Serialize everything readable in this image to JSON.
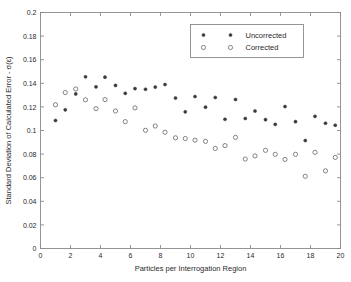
{
  "chart_data": {
    "type": "scatter",
    "title": "",
    "xlabel": "Particles per Interrogation Region",
    "ylabel": "Standard Deviation of Calculated Error - σ(ε)",
    "xlim": [
      0,
      20
    ],
    "ylim": [
      0,
      0.2
    ],
    "xticks": [
      "0",
      "2",
      "4",
      "6",
      "8",
      "10",
      "12",
      "14",
      "16",
      "18",
      "20"
    ],
    "xtick_values": [
      0,
      2,
      4,
      6,
      8,
      10,
      12,
      14,
      16,
      18,
      20
    ],
    "yticks": [
      "0",
      "0.02",
      "0.04",
      "0.06",
      "0.08",
      "0.1",
      "0.12",
      "0.14",
      "0.16",
      "0.18",
      "0.2"
    ],
    "ytick_values": [
      0,
      0.02,
      0.04,
      0.06,
      0.08,
      0.1,
      0.12,
      0.14,
      0.16,
      0.18,
      0.2
    ],
    "grid": false,
    "legend_position": "top-right",
    "series": [
      {
        "name": "Uncorrected",
        "marker": "filled-circle",
        "color": "#3a3a3a",
        "x": [
          1.0,
          1.65,
          2.35,
          3.0,
          3.7,
          4.3,
          5.0,
          5.65,
          6.3,
          7.0,
          7.65,
          8.3,
          9.0,
          9.65,
          10.3,
          11.0,
          11.65,
          12.3,
          13.0,
          13.65,
          14.3,
          15.0,
          15.65,
          16.3,
          17.0,
          17.65,
          18.3,
          19.0,
          19.65
        ],
        "y": [
          0.1085,
          0.1175,
          0.131,
          0.1455,
          0.137,
          0.1452,
          0.1382,
          0.1315,
          0.1355,
          0.135,
          0.1368,
          0.139,
          0.1275,
          0.1158,
          0.1288,
          0.1198,
          0.128,
          0.1095,
          0.1263,
          0.1102,
          0.1165,
          0.1092,
          0.1052,
          0.1203,
          0.1075,
          0.0915,
          0.112,
          0.1062,
          0.1045
        ]
      },
      {
        "name": "Corrected",
        "marker": "open-circle",
        "color": "#6e6e6e",
        "x": [
          1.0,
          1.65,
          2.35,
          3.0,
          3.7,
          4.3,
          5.0,
          5.65,
          6.3,
          7.0,
          7.65,
          8.3,
          9.0,
          9.65,
          10.3,
          11.0,
          11.65,
          12.3,
          13.0,
          13.65,
          14.3,
          15.0,
          15.65,
          16.3,
          17.0,
          17.65,
          18.3,
          19.0,
          19.65
        ],
        "y": [
          0.1218,
          0.1322,
          0.1352,
          0.126,
          0.1185,
          0.1262,
          0.1165,
          0.1075,
          0.1192,
          0.1002,
          0.1038,
          0.0985,
          0.0938,
          0.0932,
          0.0918,
          0.0908,
          0.0848,
          0.0872,
          0.0942,
          0.0758,
          0.0785,
          0.0832,
          0.0798,
          0.0755,
          0.0798,
          0.0612,
          0.0815,
          0.0658,
          0.0772
        ]
      }
    ]
  },
  "legend": {
    "entries": [
      {
        "label": "Uncorrected"
      },
      {
        "label": "Corrected"
      }
    ]
  }
}
